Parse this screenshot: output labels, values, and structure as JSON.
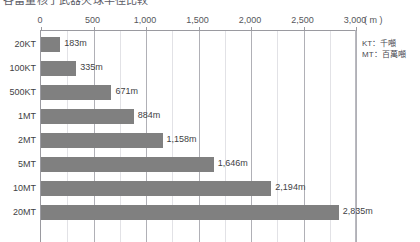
{
  "title": "各當量核子武器火球半徑比較",
  "legend": {
    "lines": [
      "KT：千噸",
      "MT：百萬噸"
    ]
  },
  "axis": {
    "unit_label": "( m )",
    "ticks": [
      "0",
      "500",
      "1,000",
      "1,500",
      "2,000",
      "2,500",
      "3,000"
    ]
  },
  "chart_data": {
    "type": "bar",
    "orientation": "horizontal",
    "title": "各當量核子武器火球半徑比較",
    "xlabel": "( m )",
    "ylabel": "",
    "xlim": [
      0,
      3000
    ],
    "grid": true,
    "legend_position": "outside-right",
    "categories": [
      "20KT",
      "100KT",
      "500KT",
      "1MT",
      "2MT",
      "5MT",
      "10MT",
      "20MT"
    ],
    "values": [
      183,
      335,
      671,
      884,
      1158,
      1646,
      2194,
      2835
    ],
    "value_labels": [
      "183m",
      "335m",
      "671m",
      "884m",
      "1,158m",
      "1,646m",
      "2,194m",
      "2,835m"
    ],
    "tick_values": [
      0,
      500,
      1000,
      1500,
      2000,
      2500,
      3000
    ],
    "tick_labels": [
      "0",
      "500",
      "1,000",
      "1,500",
      "2,000",
      "2,500",
      "3,000"
    ],
    "bar_color": "#808080",
    "annotations": [
      "KT：千噸",
      "MT：百萬噸"
    ]
  }
}
